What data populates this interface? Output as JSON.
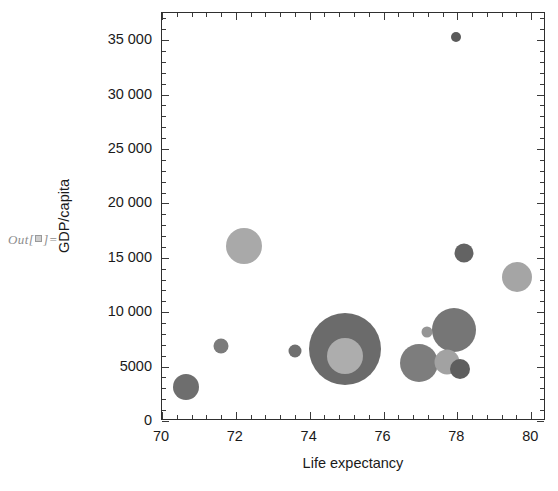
{
  "notebook": {
    "out_prompt_prefix": "Out[",
    "out_prompt_suffix": "]="
  },
  "chart_data": {
    "type": "scatter",
    "variant": "bubble",
    "title": "",
    "xlabel": "Life expectancy",
    "ylabel": "GDP/capita",
    "xlim": [
      70,
      80.4
    ],
    "ylim": [
      0,
      37500
    ],
    "grid": false,
    "legend": null,
    "frame": true,
    "x_ticks": [
      70,
      72,
      74,
      76,
      78,
      80
    ],
    "x_tick_labels": [
      "70",
      "72",
      "74",
      "76",
      "78",
      "80"
    ],
    "x_minor_per_interval": 4,
    "y_ticks": [
      0,
      5000,
      10000,
      15000,
      20000,
      25000,
      30000,
      35000
    ],
    "y_tick_labels": [
      "0",
      "5000",
      "10 000",
      "15 000",
      "20 000",
      "25 000",
      "30 000",
      "35 000"
    ],
    "y_minor_per_interval": 4,
    "size_encoding": "population",
    "points": [
      {
        "label": "p1",
        "x": 70.65,
        "y": 3100,
        "r": 13.0,
        "color": "#6e6e6e"
      },
      {
        "label": "p2",
        "x": 71.6,
        "y": 6900,
        "r": 7.5,
        "color": "#7b7b7b"
      },
      {
        "label": "p3",
        "x": 72.22,
        "y": 16100,
        "r": 18.0,
        "color": "#a9a9a9"
      },
      {
        "label": "p4",
        "x": 73.6,
        "y": 6450,
        "r": 6.5,
        "color": "#6f6f6f"
      },
      {
        "label": "p5",
        "x": 74.95,
        "y": 6650,
        "r": 36.0,
        "color": "#6b6b6b"
      },
      {
        "label": "p6",
        "x": 74.95,
        "y": 5950,
        "r": 18.0,
        "color": "#adadad"
      },
      {
        "label": "p7",
        "x": 76.95,
        "y": 5350,
        "r": 19.0,
        "color": "#7d7d7d"
      },
      {
        "label": "p8",
        "x": 77.18,
        "y": 8150,
        "r": 5.5,
        "color": "#959595"
      },
      {
        "label": "p9",
        "x": 77.9,
        "y": 8350,
        "r": 22.0,
        "color": "#767676"
      },
      {
        "label": "p10",
        "x": 77.72,
        "y": 5450,
        "r": 12.5,
        "color": "#a2a2a2"
      },
      {
        "label": "p11",
        "x": 78.08,
        "y": 4800,
        "r": 10.0,
        "color": "#5e5e5e"
      },
      {
        "label": "p12",
        "x": 78.17,
        "y": 15400,
        "r": 9.5,
        "color": "#636363"
      },
      {
        "label": "p13",
        "x": 77.95,
        "y": 35300,
        "r": 5.0,
        "color": "#5a5a5a"
      },
      {
        "label": "p14",
        "x": 79.62,
        "y": 13200,
        "r": 15.0,
        "color": "#a5a5a5"
      }
    ]
  },
  "style": {
    "frame_color": "#2f2f2f",
    "tick_color": "#3a3a3a",
    "text_color": "#1a1a1a",
    "prompt_color": "#8d8d8d",
    "background": "#ffffff"
  }
}
